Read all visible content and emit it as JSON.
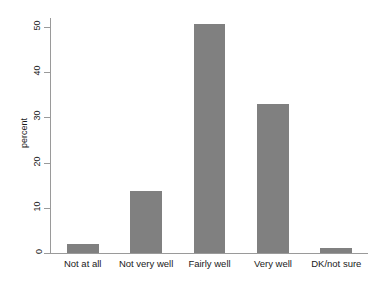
{
  "chart_data": {
    "type": "bar",
    "title": "",
    "subtitle": "",
    "xlabel": "",
    "ylabel": "percent",
    "categories": [
      "Not at all",
      "Not very well",
      "Fairly well",
      "Very well",
      "DK/not sure"
    ],
    "values": [
      2.0,
      13.7,
      50.6,
      33.0,
      1.0
    ],
    "ylim": [
      0,
      52
    ],
    "yticks": [
      0,
      10,
      20,
      30,
      40,
      50
    ],
    "ytick_labels": [
      "0",
      "10",
      "20",
      "30",
      "40",
      "50"
    ],
    "grid": false,
    "legend": "none",
    "bar_color": "#808080",
    "axis_color": "#9a9a9a",
    "background": "#ffffff"
  },
  "axis": {
    "y_title": "percent"
  }
}
